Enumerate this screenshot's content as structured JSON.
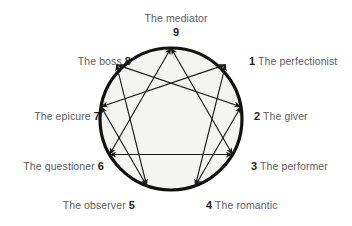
{
  "diagram": {
    "name": "enneagram",
    "type": "enneagram-personality-diagram",
    "circle": {
      "fill_color": "#f4f4f2",
      "stroke_color": "#111111",
      "center_x": 171,
      "center_y": 119,
      "radius": 71,
      "stroke_width": 3.2
    },
    "lines": {
      "stroke_color": "#1a1a1a",
      "arrowheads": "double",
      "triangle_path": [
        9,
        3,
        6
      ],
      "hexad_path": [
        1,
        4,
        2,
        8,
        5,
        7
      ]
    },
    "points": [
      {
        "number": "9",
        "label": "The mediator",
        "position": "top",
        "number_side": "below",
        "angle_deg": -90
      },
      {
        "number": "1",
        "label": "The perfectionist",
        "position": "upper-right",
        "number_side": "left",
        "angle_deg": -50
      },
      {
        "number": "2",
        "label": "The giver",
        "position": "right",
        "number_side": "left",
        "angle_deg": -10
      },
      {
        "number": "3",
        "label": "The performer",
        "position": "lower-right",
        "number_side": "left",
        "angle_deg": 30
      },
      {
        "number": "4",
        "label": "The romantic",
        "position": "bottom-right",
        "number_side": "left",
        "angle_deg": 70
      },
      {
        "number": "5",
        "label": "The observer",
        "position": "bottom-left",
        "number_side": "right",
        "angle_deg": 110
      },
      {
        "number": "6",
        "label": "The questioner",
        "position": "lower-left",
        "number_side": "right",
        "angle_deg": 150
      },
      {
        "number": "7",
        "label": "The epicure",
        "position": "left",
        "number_side": "right",
        "angle_deg": 190
      },
      {
        "number": "8",
        "label": "The boss",
        "position": "upper-left",
        "number_side": "right",
        "angle_deg": 230
      }
    ]
  }
}
